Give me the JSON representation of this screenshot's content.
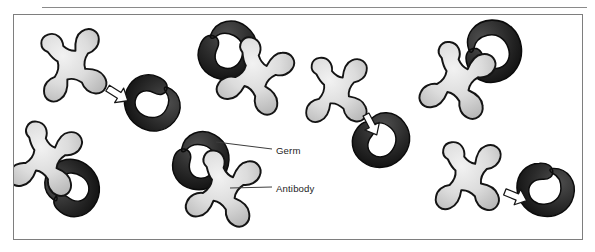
{
  "figure": {
    "title_rule": "horizontal-divider",
    "background": "#ffffff",
    "frame_border_color": "#7e7e7e",
    "rule_color": "#8a8a8a"
  },
  "labels": [
    {
      "id": "germ",
      "text": "Germ",
      "leader_from": [
        270,
        149
      ],
      "leader_to": [
        218,
        141
      ]
    },
    {
      "id": "antibody",
      "text": "Antibody",
      "leader_from": [
        270,
        187
      ],
      "leader_to": [
        228,
        187
      ]
    }
  ],
  "colors": {
    "antibody_fill": "#d2d2d2",
    "antibody_highlight": "#efefef",
    "antibody_outline": "#1a1a1a",
    "germ_fill": "#3a3a3a",
    "germ_dark": "#141414",
    "germ_outline": "#0d0d0d",
    "arrow_fill": "#ffffff",
    "arrow_outline": "#1a1a1a",
    "leader_line": "#3c3c3c"
  },
  "legend_meaning": {
    "antibody": "light gray four-lobed X-shaped molecule",
    "germ": "dark crescent kidney-bean shaped microbe",
    "arrow": "white hollow arrow indicating antibody binding to germ"
  },
  "scene": {
    "description": "Antibodies binding to germs",
    "groups": [
      {
        "name": "pair-1-top-left",
        "antibody": true,
        "germ": true,
        "arrow": true,
        "bound": false
      },
      {
        "name": "pair-2-top-center",
        "antibody": true,
        "germ": true,
        "arrow": false,
        "bound": true
      },
      {
        "name": "pair-3-top-right",
        "antibody": true,
        "germ": true,
        "arrow": false,
        "bound": true
      },
      {
        "name": "pair-4-mid-center",
        "antibody": true,
        "germ": true,
        "arrow": true,
        "bound": false
      },
      {
        "name": "pair-5-bottom-left",
        "antibody": true,
        "germ": true,
        "arrow": false,
        "bound": true
      },
      {
        "name": "pair-6-bottom-center",
        "antibody": true,
        "germ": true,
        "arrow": false,
        "bound": true
      },
      {
        "name": "pair-7-bottom-right",
        "antibody": true,
        "germ": true,
        "arrow": true,
        "bound": false
      }
    ],
    "counts": {
      "antibodies": 7,
      "germs": 7,
      "arrows": 3
    }
  }
}
